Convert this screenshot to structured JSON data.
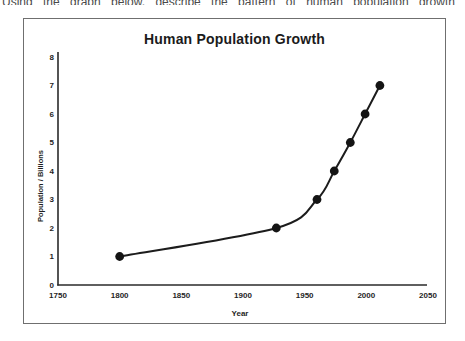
{
  "page": {
    "background": "#ffffff",
    "cropped_caption": "Using the graph below, describe the pattern of human population growth"
  },
  "chart_data": {
    "type": "line",
    "title": "Human Population Growth",
    "xlabel": "Year",
    "ylabel": "Population / Billions",
    "x": [
      1800,
      1927,
      1960,
      1974,
      1987,
      1999,
      2011
    ],
    "y": [
      1,
      2,
      3,
      4,
      5,
      6,
      7
    ],
    "x_ticks": [
      1750,
      1800,
      1850,
      1900,
      1950,
      2000,
      2050
    ],
    "y_ticks": [
      0,
      1,
      2,
      3,
      4,
      5,
      6,
      7,
      8
    ],
    "xlim": [
      1750,
      2050
    ],
    "ylim": [
      0,
      8
    ],
    "grid": false,
    "legend": "none",
    "marker": "filled-circle",
    "colors": {
      "line": "#1c1c1c",
      "marker": "#141414",
      "axis": "#2a2a2a",
      "tick_text": "#1f1f1f",
      "title_text": "#1b1b1b",
      "frame_border": "#6f6f6f"
    }
  }
}
